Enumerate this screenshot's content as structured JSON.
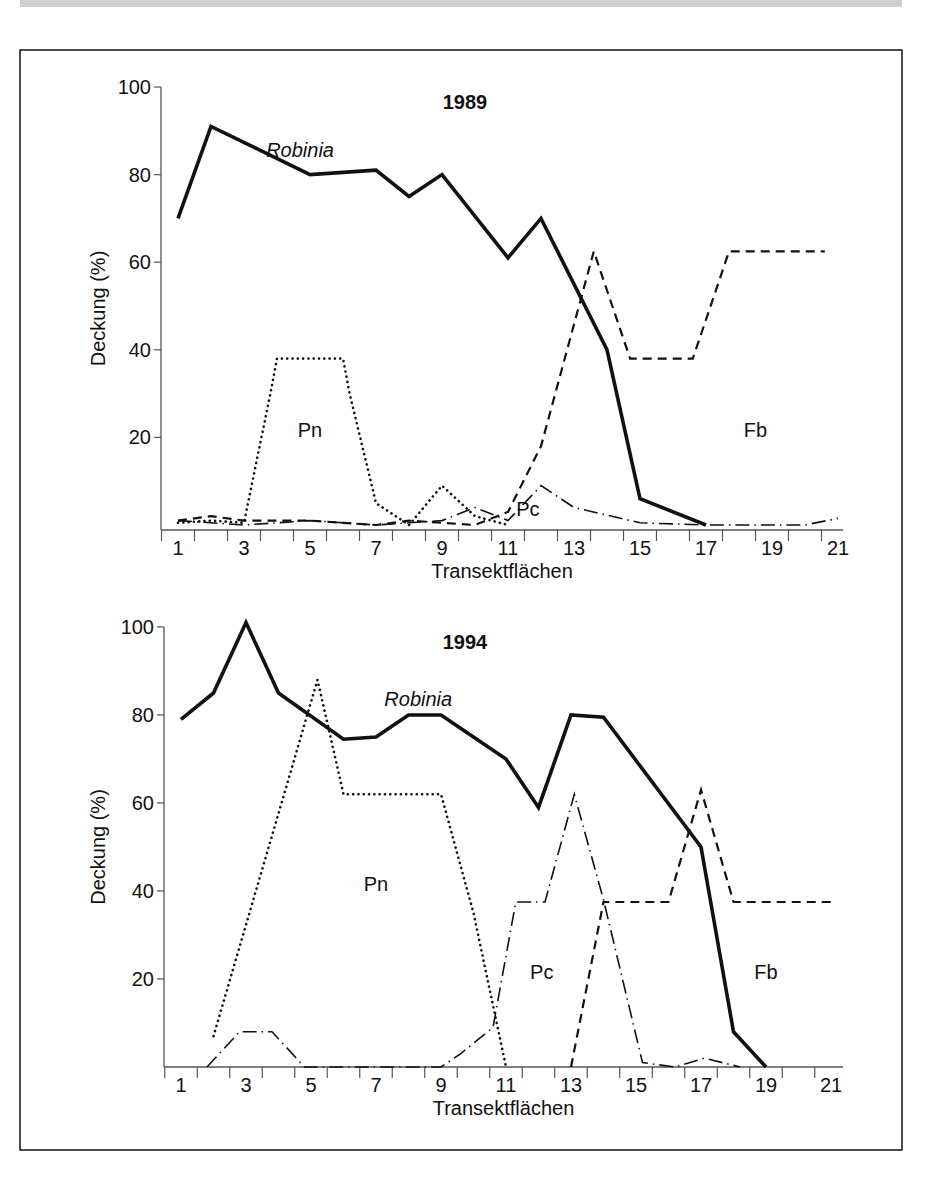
{
  "figure": {
    "panels_count": 2
  },
  "chart_data": [
    {
      "type": "line",
      "title": "1989",
      "xlabel": "Transektflächen",
      "ylabel": "Deckung (%)",
      "xlim": [
        1,
        21
      ],
      "ylim": [
        0,
        100
      ],
      "xticks": [
        1,
        3,
        5,
        7,
        9,
        11,
        13,
        15,
        17,
        19,
        21
      ],
      "yticks": [
        20,
        40,
        60,
        80,
        100
      ],
      "grid": false,
      "series": [
        {
          "name": "Robinia",
          "style": "solid",
          "label_pos": [
            4.7,
            84
          ],
          "x": [
            1,
            2,
            5,
            7,
            8,
            9,
            11,
            12,
            14,
            15,
            17
          ],
          "y": [
            70,
            91,
            80,
            81,
            75,
            80,
            61,
            70,
            40,
            6,
            0
          ]
        },
        {
          "name": "Pn",
          "style": "dotted",
          "label_pos": [
            5,
            20
          ],
          "x": [
            1,
            2,
            3,
            3.8,
            4,
            6,
            6.2,
            7,
            8,
            9,
            10,
            11
          ],
          "y": [
            0.5,
            1,
            0.5,
            30,
            38,
            38,
            30,
            5,
            0,
            9,
            2,
            0
          ]
        },
        {
          "name": "Fb",
          "style": "dashed",
          "label_pos": [
            18.5,
            20
          ],
          "x": [
            1,
            2,
            3,
            4,
            5,
            6,
            7,
            8,
            9,
            10,
            11,
            12,
            13.6,
            14.7,
            16.6,
            17.7,
            20.6
          ],
          "y": [
            1,
            2,
            1,
            1,
            1,
            0.5,
            0,
            1,
            0.5,
            0,
            3,
            18,
            62.5,
            38,
            38,
            62.5,
            62.5
          ]
        },
        {
          "name": "Pc",
          "style": "dashdot",
          "label_pos": [
            11.6,
            2
          ],
          "x": [
            1,
            3,
            5,
            7,
            8,
            9,
            10,
            11,
            12,
            13,
            15,
            17,
            19,
            20,
            21
          ],
          "y": [
            1,
            0,
            1,
            0,
            0.5,
            1,
            4,
            1,
            9,
            4,
            0.5,
            0,
            0,
            0,
            1.5
          ]
        }
      ]
    },
    {
      "type": "line",
      "title": "1994",
      "xlabel": "Transektflächen",
      "ylabel": "Deckung (%)",
      "xlim": [
        1,
        21
      ],
      "ylim": [
        0,
        100
      ],
      "xticks": [
        1,
        3,
        5,
        7,
        9,
        11,
        13,
        15,
        17,
        19,
        21
      ],
      "yticks": [
        20,
        40,
        60,
        80,
        100
      ],
      "grid": false,
      "series": [
        {
          "name": "Robinia",
          "style": "solid",
          "label_pos": [
            8.3,
            82
          ],
          "x": [
            1,
            2,
            3,
            4,
            6,
            7,
            8,
            9,
            11,
            12,
            13,
            14,
            17,
            18,
            19
          ],
          "y": [
            79,
            85,
            101,
            85,
            74.5,
            75,
            80,
            80,
            70,
            59,
            80,
            79.5,
            50,
            8,
            0
          ]
        },
        {
          "name": "Pn",
          "style": "dotted",
          "label_pos": [
            7,
            40
          ],
          "x": [
            2,
            5.2,
            6,
            9,
            10,
            11
          ],
          "y": [
            7,
            88,
            62,
            62,
            35,
            0
          ]
        },
        {
          "name": "Fb",
          "style": "dashed",
          "label_pos": [
            19,
            20
          ],
          "x": [
            13,
            14,
            16,
            17,
            18,
            21
          ],
          "y": [
            0,
            37.5,
            37.5,
            63,
            37.5,
            37.5
          ]
        },
        {
          "name": "Pc",
          "style": "dashdot",
          "label_pos": [
            12.1,
            20
          ],
          "x": [
            1.8,
            2.8,
            3.8,
            4.8,
            9,
            9.6,
            10.6,
            11.3,
            12.2,
            13.1,
            14,
            15.2,
            16.2,
            17.1,
            18.2
          ],
          "y": [
            0,
            8,
            8,
            0,
            0,
            3,
            9,
            37.5,
            37.5,
            62,
            38,
            1,
            0,
            2,
            0
          ]
        }
      ]
    }
  ]
}
